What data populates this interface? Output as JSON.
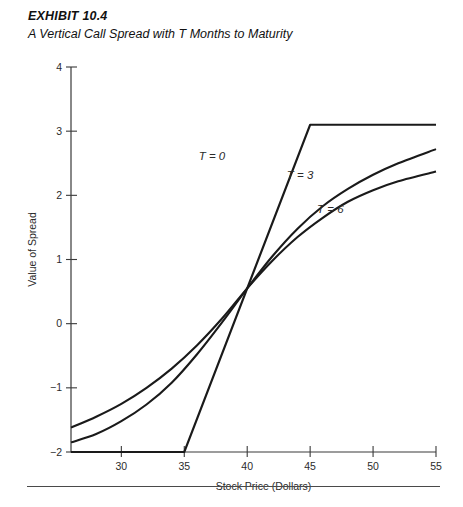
{
  "header": {
    "exhibit_label": "EXHIBIT 10.4",
    "subtitle": "A Vertical Call Spread with T Months to Maturity"
  },
  "chart_data": {
    "type": "line",
    "title": "A Vertical Call Spread with T Months to Maturity",
    "xlabel": "Stock Price (Dollars)",
    "ylabel": "Value of Spread",
    "xlim": [
      26,
      55
    ],
    "ylim": [
      -2,
      4
    ],
    "xticks": [
      30,
      35,
      40,
      45,
      50,
      55
    ],
    "yticks": [
      -2,
      -1,
      0,
      1,
      2,
      3,
      4
    ],
    "xtick_labels": [
      "30",
      "35",
      "40",
      "45",
      "50",
      "55"
    ],
    "ytick_labels": [
      "−2",
      "−1",
      "0",
      "1",
      "2",
      "3",
      "4"
    ],
    "grid": false,
    "legend_position": "inline-annotations",
    "series": [
      {
        "name": "T = 0",
        "label": "T = 0",
        "label_x": 37.2,
        "label_y": 2.55,
        "x": [
          26,
          35,
          45,
          55
        ],
        "y": [
          -2,
          -2,
          3.1,
          3.1
        ]
      },
      {
        "name": "T = 3",
        "label": "T = 3",
        "label_x": 44.2,
        "label_y": 2.25,
        "x": [
          26,
          28,
          30,
          32,
          34,
          36,
          38,
          40,
          42,
          44,
          46,
          48,
          50,
          52,
          55
        ],
        "y": [
          -1.85,
          -1.72,
          -1.52,
          -1.26,
          -0.92,
          -0.48,
          0.02,
          0.55,
          1.05,
          1.48,
          1.83,
          2.1,
          2.32,
          2.5,
          2.72
        ]
      },
      {
        "name": "T = 6",
        "label": "T = 6",
        "label_x": 46.6,
        "label_y": 1.72,
        "x": [
          26,
          28,
          30,
          32,
          34,
          36,
          38,
          40,
          42,
          44,
          46,
          48,
          50,
          52,
          55
        ],
        "y": [
          -1.62,
          -1.45,
          -1.25,
          -1.0,
          -0.7,
          -0.34,
          0.08,
          0.55,
          0.98,
          1.35,
          1.65,
          1.9,
          2.08,
          2.22,
          2.37
        ]
      }
    ]
  },
  "colors": {
    "curve": "#1a1a1a",
    "axis": "#3a3a3a",
    "text": "#2b2b2b",
    "rule": "#4a4a4a"
  }
}
